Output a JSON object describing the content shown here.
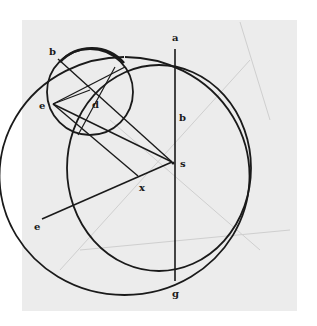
{
  "figure": {
    "type": "geometric astronomical diagram",
    "labels": {
      "a": "a",
      "b_top": "b",
      "b_mid": "b",
      "d": "d",
      "e_upper": "e",
      "e_lower": "e",
      "s": "s",
      "x": "x",
      "g": "g"
    },
    "colors": {
      "paper": "#ececec",
      "ink": "#1a1a1a",
      "faint": "#c8c8c8"
    }
  }
}
